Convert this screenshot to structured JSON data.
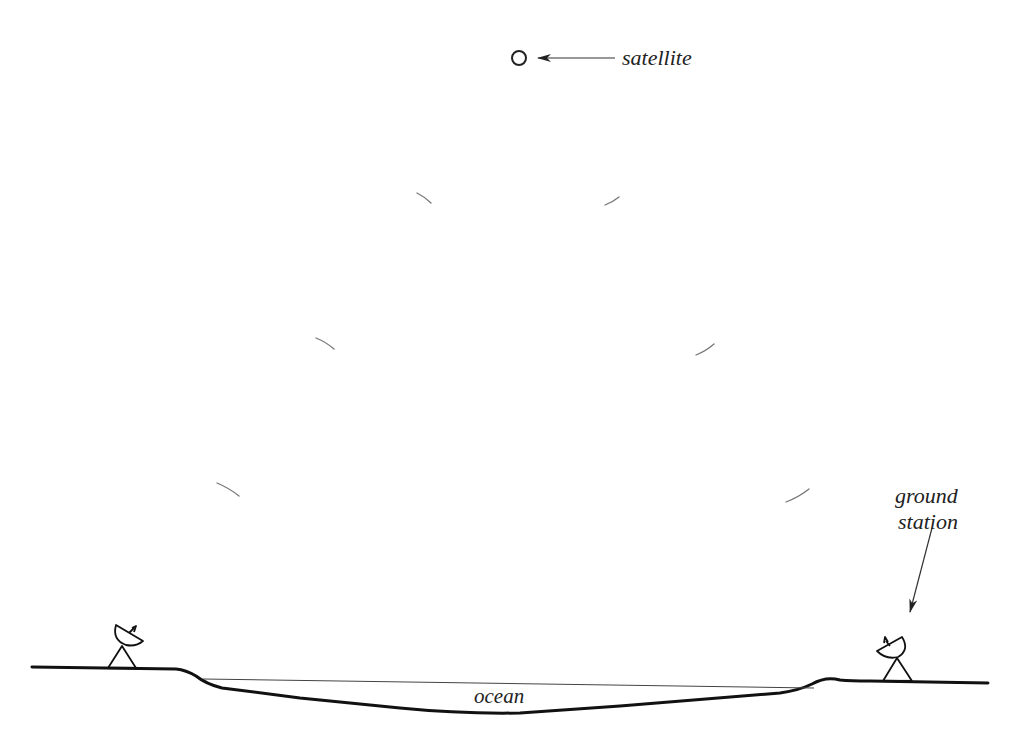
{
  "diagram": {
    "type": "satellite-communication-illustration",
    "labels": {
      "satellite": "satellite",
      "ground_station_line1": "ground",
      "ground_station_line2": "station",
      "ocean": "ocean"
    },
    "elements": {
      "satellite": {
        "shape": "circle",
        "cx": 519,
        "cy": 58,
        "r": 7
      },
      "satellite_arrow": {
        "from": [
          615,
          58
        ],
        "to": [
          538,
          58
        ]
      },
      "ground_station_arrow": {
        "from": [
          932,
          528
        ],
        "to": [
          910,
          612
        ]
      },
      "signal_arcs_left": [
        {
          "from": [
            417,
            193
          ],
          "to": [
            431,
            203
          ]
        },
        {
          "from": [
            316,
            338
          ],
          "to": [
            334,
            349
          ]
        },
        {
          "from": [
            217,
            483
          ],
          "to": [
            239,
            496
          ]
        }
      ],
      "signal_arcs_right": [
        {
          "from": [
            605,
            205
          ],
          "to": [
            619,
            197
          ]
        },
        {
          "from": [
            696,
            355
          ],
          "to": [
            714,
            344
          ]
        },
        {
          "from": [
            786,
            502
          ],
          "to": [
            809,
            489
          ]
        }
      ],
      "dishes": [
        {
          "name": "left-ground-station",
          "base_left": [
            108,
            668
          ],
          "base_right": [
            136,
            668
          ],
          "apex": [
            122,
            646
          ]
        },
        {
          "name": "right-ground-station",
          "base_left": [
            883,
            681
          ],
          "base_right": [
            912,
            681
          ],
          "apex": [
            897,
            658
          ]
        }
      ]
    },
    "colors": {
      "line": "#111111",
      "arc": "#777777",
      "text": "#222222",
      "background": "#ffffff"
    }
  }
}
